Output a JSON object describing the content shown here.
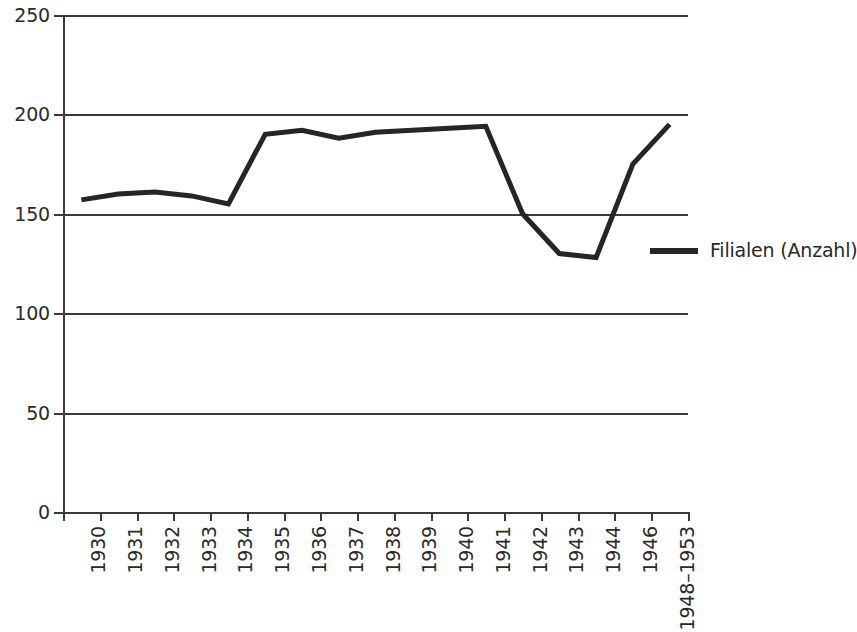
{
  "chart_data": {
    "type": "line",
    "title": "",
    "subtitle": "",
    "xlabel": "",
    "ylabel": "",
    "categories": [
      "1930",
      "1931",
      "1932",
      "1933",
      "1934",
      "1935",
      "1936",
      "1937",
      "1938",
      "1939",
      "1940",
      "1941",
      "1942",
      "1943",
      "1944",
      "1946",
      "1948–1953"
    ],
    "series": [
      {
        "name": "Filialen (Anzahl)",
        "color": "#262626",
        "values": [
          157,
          160,
          161,
          159,
          155,
          190,
          192,
          188,
          191,
          192,
          193,
          194,
          150,
          130,
          128,
          175,
          195
        ]
      }
    ],
    "ylim": [
      0,
      250
    ],
    "y_ticks": [
      0,
      50,
      100,
      150,
      200,
      250
    ],
    "y_tick_labels": [
      "0",
      "50",
      "100",
      "150",
      "200",
      "250"
    ],
    "grid": "horizontal",
    "legend_position": "right-middle",
    "axis_color": "#3a3a3a",
    "text_color": "#2a2a2a",
    "background": "#ffffff"
  },
  "legend": {
    "entries": [
      {
        "label": "Filialen (Anzahl)",
        "color": "#262626"
      }
    ]
  }
}
